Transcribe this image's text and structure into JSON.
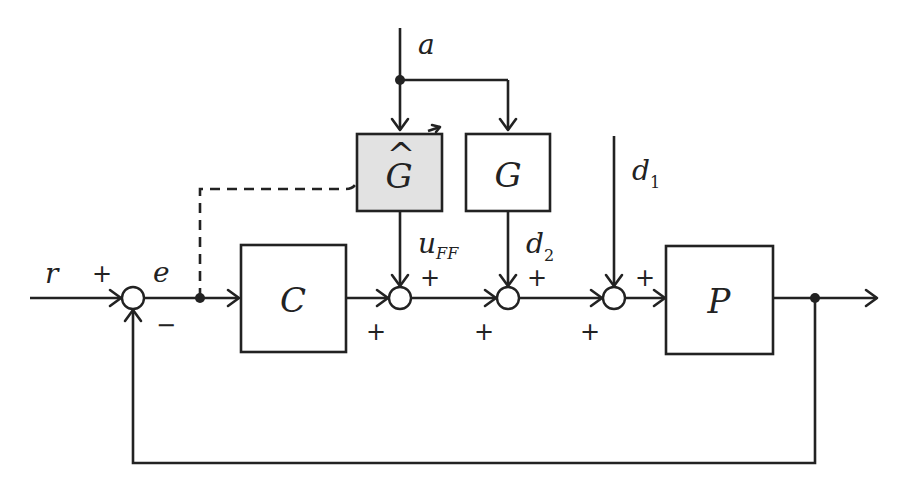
{
  "diagram": {
    "type": "feedback control block diagram",
    "blocks": {
      "controller": {
        "label": "C"
      },
      "plant": {
        "label": "P"
      },
      "model": {
        "label": "Ĝ",
        "base": "G",
        "hat": "^",
        "shaded": true,
        "adaptive": true
      },
      "disturbance_model": {
        "label": "G"
      }
    },
    "signals": {
      "reference": {
        "label": "r"
      },
      "error": {
        "label": "e"
      },
      "input_a": {
        "label": "a"
      },
      "feedforward": {
        "label": "u",
        "subscript": "FF"
      },
      "disturbance1": {
        "label": "d",
        "subscript": "1"
      },
      "disturbance2": {
        "label": "d",
        "subscript": "2"
      }
    },
    "signs": {
      "sum1_top": "+",
      "sum1_bottom": "−",
      "sum2_top": "+",
      "sum2_left": "+",
      "sum3_top": "+",
      "sum3_left": "+",
      "sum4_top": "+",
      "sum4_left": "+"
    },
    "colors": {
      "line": "#222222",
      "shaded_block": "#e2e2e2",
      "background": "#ffffff"
    }
  }
}
